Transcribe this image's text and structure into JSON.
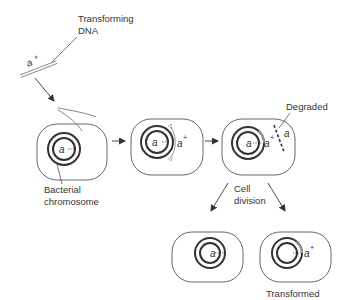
{
  "diagram": {
    "labels": {
      "transforming_dna_line1": "Transforming",
      "transforming_dna_line2": "DNA",
      "bacterial_chromosome_line1": "Bacterial",
      "bacterial_chromosome_line2": "chromosome",
      "degraded": "Degraded",
      "cell_division_line1": "Cell",
      "cell_division_line2": "division",
      "transformed_cell_line1": "Transformed",
      "transformed_cell_line2": "cell"
    },
    "genes": {
      "recessive": "a",
      "dominant": "a",
      "plus": "+"
    },
    "colors": {
      "line": "#555555",
      "chromosome": "#333333",
      "incoming_dna": "#999999",
      "text": "#333333"
    },
    "steps": [
      {
        "id": "cell-1",
        "chromosome_allele": "a",
        "description": "Transforming DNA enters cell"
      },
      {
        "id": "cell-2",
        "chromosome_allele": "a",
        "paired_allele": "a+",
        "description": "Pairing of donor DNA with chromosome"
      },
      {
        "id": "cell-3",
        "chromosome_allele": "a",
        "integrated_allele": "a+",
        "degraded_allele": "a",
        "description": "Recombination; displaced strand degraded"
      },
      {
        "id": "daughter-left",
        "chromosome_allele": "a",
        "description": "Untransformed daughter cell"
      },
      {
        "id": "daughter-right",
        "chromosome_allele": "a+",
        "description": "Transformed cell"
      }
    ]
  }
}
